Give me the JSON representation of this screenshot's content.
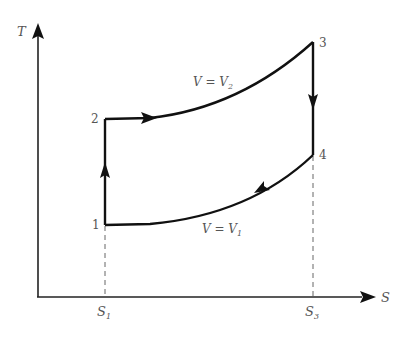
{
  "diagram": {
    "axes": {
      "y_label": "T",
      "x_label": "S"
    },
    "points": [
      {
        "id": "1",
        "label": "1"
      },
      {
        "id": "2",
        "label": "2"
      },
      {
        "id": "3",
        "label": "3"
      },
      {
        "id": "4",
        "label": "4"
      }
    ],
    "ticks": {
      "s1": {
        "main": "S",
        "sub": "1"
      },
      "s3": {
        "main": "S",
        "sub": "3"
      }
    },
    "curves": {
      "upper": {
        "lhs": "V = V",
        "sub": "2"
      },
      "lower": {
        "lhs": "V = V",
        "sub": "1"
      }
    },
    "processes": [
      {
        "from": "1",
        "to": "2",
        "type": "isentropic",
        "direction": "up"
      },
      {
        "from": "2",
        "to": "3",
        "type": "isochoric V = V2",
        "direction": "right"
      },
      {
        "from": "3",
        "to": "4",
        "type": "isentropic",
        "direction": "down"
      },
      {
        "from": "4",
        "to": "1",
        "type": "isochoric V = V1",
        "direction": "left"
      }
    ],
    "colors": {
      "line": "#111111",
      "text": "#555555",
      "dashed": "#666666"
    }
  }
}
